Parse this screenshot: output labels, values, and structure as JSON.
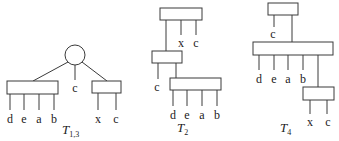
{
  "diagram": {
    "trees": [
      {
        "id": "T13",
        "title": "T",
        "subscript": "1,3",
        "root": "circle",
        "leaf_labels": {
          "left_box": [
            "d",
            "e",
            "a",
            "b"
          ],
          "middle": "c",
          "right_box": [
            "x",
            "c"
          ]
        }
      },
      {
        "id": "T2",
        "title": "T",
        "subscript": "2",
        "leaf_labels": {
          "top_box": [
            "x",
            "c"
          ],
          "middle_box": [
            "c"
          ],
          "bottom_box": [
            "d",
            "e",
            "a",
            "b"
          ]
        }
      },
      {
        "id": "T4",
        "title": "T",
        "subscript": "4",
        "leaf_labels": {
          "top_box": [
            "c"
          ],
          "wide_box": [
            "d",
            "e",
            "a",
            "b"
          ],
          "bottom_box": [
            "x",
            "c"
          ]
        }
      }
    ]
  }
}
